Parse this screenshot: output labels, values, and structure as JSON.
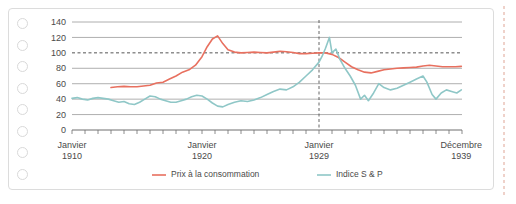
{
  "card": {
    "punch_hole_count": 8,
    "punch_icon": "punch-hole-icon"
  },
  "chart_data": {
    "type": "line",
    "title": "",
    "subtitle": "",
    "xlabel": "",
    "ylabel": "",
    "grid": true,
    "legend_position": "bottom",
    "ylim": [
      0,
      140
    ],
    "yticks": [
      0,
      20,
      40,
      60,
      80,
      100,
      120,
      140
    ],
    "ytick_labels": [
      "0",
      "20",
      "40",
      "60",
      "80",
      "100",
      "120",
      "140"
    ],
    "reference_line_y": 100,
    "reference_line_style": "dashed",
    "reference_line_x_label": "Janvier 1929",
    "reference_line_x_value": 1929.0,
    "xlim": [
      1910,
      1940
    ],
    "xtick_years": [
      1910,
      1911,
      1912,
      1913,
      1914,
      1915,
      1916,
      1917,
      1918,
      1919,
      1920,
      1921,
      1922,
      1923,
      1924,
      1925,
      1926,
      1927,
      1928,
      1929,
      1930,
      1931,
      1932,
      1933,
      1934,
      1935,
      1936,
      1937,
      1938,
      1939,
      1940
    ],
    "xtick_labels": [
      {
        "value": 1910.0,
        "line1": "Janvier",
        "line2": "1910"
      },
      {
        "value": 1920.0,
        "line1": "Janvier",
        "line2": "1920"
      },
      {
        "value": 1929.0,
        "line1": "Janvier",
        "line2": "1929"
      },
      {
        "value": 1939.95,
        "line1": "Décembre",
        "line2": "1939"
      }
    ],
    "colors": {
      "consumer_prices": "#e8705f",
      "sp_index": "#8fc7c7",
      "grid": "#9a9a9a",
      "axis": "#6e6e6e",
      "text": "#4a4a4a",
      "card_border": "#dcdcdc",
      "punch_border": "#d9d9d9"
    },
    "series": [
      {
        "name": "Prix à la consommation",
        "color": "#e8705f",
        "legend_key": "legend-consumer-prices",
        "x": [
          1913.0,
          1913.5,
          1914.0,
          1914.5,
          1915.0,
          1915.5,
          1916.0,
          1916.5,
          1917.0,
          1917.5,
          1918.0,
          1918.5,
          1919.0,
          1919.5,
          1920.0,
          1920.4,
          1920.8,
          1921.2,
          1921.6,
          1922.0,
          1922.5,
          1923.0,
          1923.5,
          1924.0,
          1924.5,
          1925.0,
          1925.5,
          1926.0,
          1926.5,
          1927.0,
          1927.5,
          1928.0,
          1928.5,
          1929.0,
          1929.5,
          1930.0,
          1930.5,
          1931.0,
          1931.5,
          1932.0,
          1932.5,
          1933.0,
          1933.5,
          1934.0,
          1934.5,
          1935.0,
          1935.5,
          1936.0,
          1936.5,
          1937.0,
          1937.5,
          1938.0,
          1938.5,
          1939.0,
          1939.5,
          1939.95
        ],
        "y": [
          55,
          56,
          56.5,
          56,
          56,
          57,
          58,
          61,
          62,
          66,
          70,
          75,
          78,
          84,
          95,
          108,
          118,
          122,
          112,
          104,
          101,
          100,
          100.5,
          101,
          100.5,
          100,
          101,
          102,
          101.5,
          100.5,
          99,
          99,
          99.5,
          100,
          100,
          98,
          94,
          88,
          82,
          78,
          75,
          74,
          76,
          78,
          79,
          80,
          80.5,
          81,
          81.5,
          83,
          84,
          83,
          82,
          82,
          82,
          82.5
        ]
      },
      {
        "name": "Indice S & P",
        "color": "#8fc7c7",
        "legend_key": "legend-sp-index",
        "x": [
          1910.0,
          1910.4,
          1910.8,
          1911.2,
          1911.6,
          1912.0,
          1912.4,
          1912.8,
          1913.2,
          1913.6,
          1914.0,
          1914.4,
          1914.8,
          1915.2,
          1915.6,
          1916.0,
          1916.4,
          1916.8,
          1917.2,
          1917.6,
          1918.0,
          1918.4,
          1918.8,
          1919.2,
          1919.6,
          1920.0,
          1920.4,
          1920.8,
          1921.2,
          1921.6,
          1922.0,
          1922.5,
          1923.0,
          1923.5,
          1924.0,
          1924.5,
          1925.0,
          1925.5,
          1926.0,
          1926.5,
          1927.0,
          1927.5,
          1928.0,
          1928.5,
          1929.0,
          1929.25,
          1929.5,
          1929.8,
          1930.0,
          1930.3,
          1930.6,
          1931.0,
          1931.4,
          1931.8,
          1932.2,
          1932.5,
          1932.8,
          1933.2,
          1933.6,
          1934.0,
          1934.5,
          1935.0,
          1935.5,
          1936.0,
          1936.5,
          1937.0,
          1937.3,
          1937.7,
          1938.0,
          1938.4,
          1938.8,
          1939.2,
          1939.6,
          1939.95
        ],
        "y": [
          41,
          42,
          40,
          39,
          41,
          42,
          41,
          40,
          38,
          36,
          37,
          34,
          33,
          36,
          40,
          44,
          43,
          40,
          38,
          36,
          36,
          38,
          40,
          43,
          45,
          44,
          40,
          35,
          31,
          30,
          33,
          36,
          38,
          37,
          39,
          42,
          46,
          50,
          53,
          52,
          56,
          62,
          70,
          78,
          88,
          96,
          106,
          120,
          100,
          105,
          92,
          80,
          70,
          58,
          40,
          45,
          38,
          48,
          60,
          55,
          52,
          54,
          58,
          62,
          66,
          70,
          62,
          46,
          40,
          48,
          52,
          50,
          48,
          52
        ]
      }
    ]
  },
  "legend": [
    {
      "key": "legend-consumer-prices",
      "label": "Prix à la consommation",
      "color": "#e8705f"
    },
    {
      "key": "legend-sp-index",
      "label": "Indice S & P",
      "color": "#8fc7c7"
    }
  ]
}
